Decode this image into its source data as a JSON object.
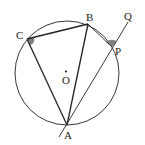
{
  "diagram": {
    "labels": {
      "A": "A",
      "B": "B",
      "C": "C",
      "P": "P",
      "Q": "Q",
      "O": "O"
    },
    "marked_angles": [
      "angle-ACB",
      "angle-BPQ"
    ],
    "colors": {
      "stroke": "#222222",
      "angle_fill": "#808080",
      "background": "#ffffff"
    }
  }
}
